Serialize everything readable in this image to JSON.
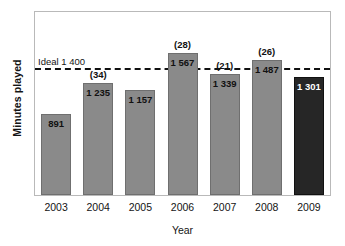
{
  "chart_data": {
    "type": "bar",
    "title": "",
    "xlabel": "Year",
    "ylabel": "Minutes played",
    "categories": [
      "2003",
      "2004",
      "2005",
      "2006",
      "2007",
      "2008",
      "2009"
    ],
    "values": [
      891,
      1235,
      1157,
      1567,
      1339,
      1487,
      1301
    ],
    "value_labels": [
      "891",
      "1 235",
      "1 157",
      "1 567",
      "1 339",
      "1 487",
      "1 301"
    ],
    "annotations": [
      "",
      "(34)",
      "",
      "(28)",
      "(21)",
      "(26)",
      ""
    ],
    "bar_colors": [
      "#8a8a8a",
      "#8a8a8a",
      "#8a8a8a",
      "#8a8a8a",
      "#8a8a8a",
      "#8a8a8a",
      "#262626"
    ],
    "highlight_category": "2009",
    "ylim": [
      0,
      2020
    ],
    "grid": false,
    "legend": false,
    "reference_line": {
      "value": 1400,
      "label": "Ideal 1 400",
      "style": "dashed",
      "color": "#111111"
    },
    "colors": {
      "bar_gray": "#8a8a8a",
      "bar_dark": "#262626",
      "frame": "#b9b9b9",
      "text": "#141414",
      "background": "#ffffff"
    }
  }
}
